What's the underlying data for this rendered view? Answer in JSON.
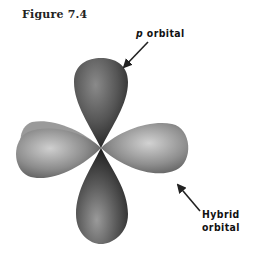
{
  "figure": {
    "label": "Figure 7.4",
    "callouts": {
      "p_orbital": {
        "prefix": "p",
        "suffix": " orbital"
      },
      "hybrid_orbital": {
        "text": "Hybrid orbital"
      }
    },
    "colors": {
      "background": "#ffffff",
      "lobe_dark": "#3a3a3a",
      "lobe_mid": "#7a7a7a",
      "lobe_light": "#bdbdbd",
      "arrow": "#222222"
    }
  }
}
